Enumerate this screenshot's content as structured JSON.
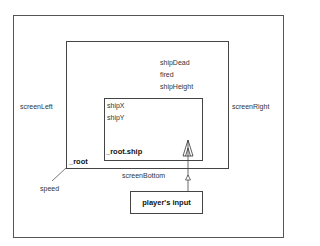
{
  "diagram": {
    "frame": {
      "label": ""
    },
    "root": {
      "label": "_root"
    },
    "root_vars": [
      "shipDead",
      "fired",
      "shipHeight"
    ],
    "ship": {
      "label": "_root.ship",
      "vars": [
        "shipX",
        "shipY"
      ]
    },
    "edges": {
      "left": "screenLeft",
      "right": "screenRight",
      "bottom": "screenBottom",
      "corner": "speed"
    },
    "input": {
      "label": "player's input"
    },
    "icons": {
      "ship": "ship-icon",
      "arrow": "arrow-up-icon"
    },
    "colors": {
      "line": "#444444",
      "text": "#333333",
      "background": "#ffffff"
    }
  }
}
